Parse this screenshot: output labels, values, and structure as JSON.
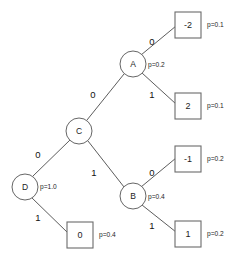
{
  "diagram": {
    "type": "decision-tree",
    "title": "",
    "background_color": "#ffffff",
    "line_color": "#4a4a4a",
    "text_color": "#1c1c1c",
    "nodes": [
      {
        "id": "D",
        "label": "D",
        "shape": "circle",
        "x": 25,
        "y": 187,
        "r": 13
      },
      {
        "id": "C",
        "label": "C",
        "shape": "circle",
        "x": 79,
        "y": 131,
        "r": 13
      },
      {
        "id": "A",
        "label": "A",
        "shape": "circle",
        "x": 133,
        "y": 64,
        "r": 13
      },
      {
        "id": "B",
        "label": "B",
        "shape": "circle",
        "x": 133,
        "y": 196,
        "r": 13
      }
    ],
    "leaves": [
      {
        "id": "leaf-neg2",
        "label": "-2",
        "x": 175,
        "y": 12,
        "w": 26,
        "h": 26
      },
      {
        "id": "leaf-2",
        "label": "2",
        "x": 175,
        "y": 93,
        "w": 26,
        "h": 26
      },
      {
        "id": "leaf-neg1",
        "label": "-1",
        "x": 175,
        "y": 146,
        "w": 26,
        "h": 26
      },
      {
        "id": "leaf-1",
        "label": "1",
        "x": 175,
        "y": 221,
        "w": 26,
        "h": 26
      },
      {
        "id": "leaf-0",
        "label": "0",
        "x": 67,
        "y": 222,
        "w": 26,
        "h": 26
      }
    ],
    "edges": [
      {
        "id": "edge-d-c",
        "from": "D",
        "to": "C",
        "label": "0",
        "label_x": 38,
        "label_y": 155
      },
      {
        "id": "edge-d-leaf0",
        "from": "D",
        "to": "leaf-0",
        "label": "1",
        "label_x": 38,
        "label_y": 218
      },
      {
        "id": "edge-c-a",
        "from": "C",
        "to": "A",
        "label": "0",
        "label_x": 93,
        "label_y": 95
      },
      {
        "id": "edge-c-b",
        "from": "C",
        "to": "B",
        "label": "1",
        "label_x": 94,
        "label_y": 173
      },
      {
        "id": "edge-a-leafneg2",
        "from": "A",
        "to": "leaf-neg2",
        "label": "0",
        "label_x": 152,
        "label_y": 42
      },
      {
        "id": "edge-a-leaf2",
        "from": "A",
        "to": "leaf-2",
        "label": "1",
        "label_x": 152,
        "label_y": 95
      },
      {
        "id": "edge-b-leafneg1",
        "from": "B",
        "to": "leaf-neg1",
        "label": "0",
        "label_x": 152,
        "label_y": 173
      },
      {
        "id": "edge-b-leaf1",
        "from": "B",
        "to": "leaf-1",
        "label": "1",
        "label_x": 152,
        "label_y": 226
      }
    ],
    "probabilities": [
      {
        "id": "prob-d",
        "text": "p=1.0",
        "x": 40,
        "y": 187
      },
      {
        "id": "prob-a",
        "text": "p=0.2",
        "x": 148,
        "y": 65
      },
      {
        "id": "prob-b",
        "text": "p=0.4",
        "x": 148,
        "y": 197
      },
      {
        "id": "prob-leafneg2",
        "text": "p=0.1",
        "x": 207,
        "y": 25
      },
      {
        "id": "prob-leaf2",
        "text": "p=0.1",
        "x": 207,
        "y": 106
      },
      {
        "id": "prob-leafneg1",
        "text": "p=0.2",
        "x": 207,
        "y": 159
      },
      {
        "id": "prob-leaf1",
        "text": "p=0.2",
        "x": 207,
        "y": 234
      },
      {
        "id": "prob-leaf0",
        "text": "p=0.4",
        "x": 99,
        "y": 235
      }
    ]
  }
}
